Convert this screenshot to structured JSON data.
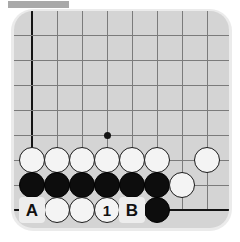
{
  "diagram": {
    "kind": "go-board-problem",
    "board": {
      "background_color": "#d4d4d4",
      "line_color": "#7b7b7b",
      "edge_line_color": "#141414",
      "cell_size": 25,
      "columns": 8,
      "rows": 8,
      "star_point": {
        "col": 3,
        "row": 4,
        "label": "hoshi"
      }
    },
    "top_strip": {
      "color": "#a9a9a9",
      "label": "gray-strip"
    },
    "colors": {
      "white_stone": "#f4f4f4",
      "black_stone": "#0d0d0d",
      "page_background": "#ffffff",
      "halo": "#ebebeb"
    },
    "edges": [
      {
        "name": "left-edge",
        "orientation": "vertical",
        "col": 0
      },
      {
        "name": "bottom-edge",
        "orientation": "horizontal",
        "row": 7
      }
    ],
    "stones": [
      {
        "id": "w-r5-c0",
        "color": "white",
        "col": 0,
        "row": 5,
        "label": ""
      },
      {
        "id": "w-r5-c1",
        "color": "white",
        "col": 1,
        "row": 5,
        "label": ""
      },
      {
        "id": "w-r5-c2",
        "color": "white",
        "col": 2,
        "row": 5,
        "label": ""
      },
      {
        "id": "w-r5-c3",
        "color": "white",
        "col": 3,
        "row": 5,
        "label": ""
      },
      {
        "id": "w-r5-c4",
        "color": "white",
        "col": 4,
        "row": 5,
        "label": ""
      },
      {
        "id": "w-r5-c5",
        "color": "white",
        "col": 5,
        "row": 5,
        "label": ""
      },
      {
        "id": "w-r5-c7",
        "color": "white",
        "col": 7,
        "row": 5,
        "label": ""
      },
      {
        "id": "b-r6-c0",
        "color": "black",
        "col": 0,
        "row": 6,
        "label": ""
      },
      {
        "id": "b-r6-c1",
        "color": "black",
        "col": 1,
        "row": 6,
        "label": ""
      },
      {
        "id": "b-r6-c2",
        "color": "black",
        "col": 2,
        "row": 6,
        "label": ""
      },
      {
        "id": "b-r6-c3",
        "color": "black",
        "col": 3,
        "row": 6,
        "label": ""
      },
      {
        "id": "b-r6-c4",
        "color": "black",
        "col": 4,
        "row": 6,
        "label": ""
      },
      {
        "id": "b-r6-c5",
        "color": "black",
        "col": 5,
        "row": 6,
        "label": ""
      },
      {
        "id": "w-r6-c6",
        "color": "white",
        "col": 6,
        "row": 6,
        "label": ""
      },
      {
        "id": "w-r7-c1",
        "color": "white",
        "col": 1,
        "row": 7,
        "label": ""
      },
      {
        "id": "w-r7-c2",
        "color": "white",
        "col": 2,
        "row": 7,
        "label": ""
      },
      {
        "id": "w-r7-c3",
        "color": "white",
        "col": 3,
        "row": 7,
        "label": "1"
      },
      {
        "id": "b-r7-c5",
        "color": "black",
        "col": 5,
        "row": 7,
        "label": ""
      }
    ],
    "point_labels": [
      {
        "id": "label-A",
        "text": "A",
        "col": 0,
        "row": 7
      },
      {
        "id": "label-B",
        "text": "B",
        "col": 4,
        "row": 7
      }
    ]
  }
}
